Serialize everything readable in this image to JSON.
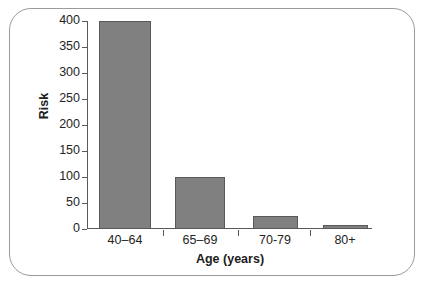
{
  "chart_data": {
    "type": "bar",
    "title": "",
    "subtitle": "",
    "xlabel": "Age (years)",
    "ylabel": "Risk",
    "categories": [
      "40–64",
      "65–69",
      "70-79",
      "80+"
    ],
    "values": [
      400,
      100,
      25,
      7
    ],
    "ylim": [
      0,
      400
    ],
    "yticks": [
      0,
      50,
      100,
      150,
      200,
      250,
      300,
      350,
      400
    ],
    "ytick_labels": [
      "0",
      "50",
      "100",
      "150",
      "200",
      "250",
      "300",
      "350",
      "400"
    ],
    "grid": false,
    "legend": null,
    "legend_position": "none",
    "series": [
      {
        "name": "Risk",
        "values": [
          400,
          100,
          25,
          7
        ],
        "color": "#808080",
        "edge_color": "#595959"
      }
    ],
    "annotations": [],
    "colors": {
      "bar_fill": "#808080",
      "bar_edge": "#595959",
      "axis": "#5a5a5a",
      "text": "#242424",
      "frame_border": "#9a9a9a",
      "background": "#ffffff"
    }
  }
}
